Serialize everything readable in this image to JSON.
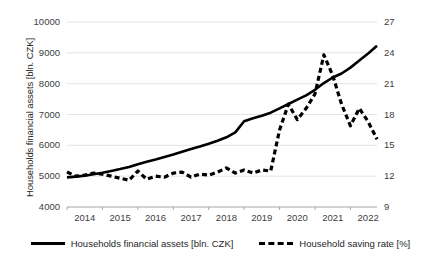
{
  "chart_data": {
    "type": "line",
    "title": "",
    "xlabel": "",
    "ylabel": "Households financial assets [bln. CZK]",
    "y2label": "Household saving rate [%]",
    "grid": true,
    "legend_position": "bottom",
    "x_tick_labels": [
      "2014",
      "2015",
      "2016",
      "2017",
      "2018",
      "2019",
      "2020",
      "2021",
      "2022"
    ],
    "y_left_ticks": [
      4000,
      5000,
      6000,
      7000,
      8000,
      9000,
      10000
    ],
    "y_right_ticks": [
      9,
      12,
      15,
      18,
      21,
      24,
      27
    ],
    "ylim": [
      4000,
      10000
    ],
    "y2lim": [
      9,
      27
    ],
    "x": [
      "2014Q1",
      "2014Q2",
      "2014Q3",
      "2014Q4",
      "2015Q1",
      "2015Q2",
      "2015Q3",
      "2015Q4",
      "2016Q1",
      "2016Q2",
      "2016Q3",
      "2016Q4",
      "2017Q1",
      "2017Q2",
      "2017Q3",
      "2017Q4",
      "2018Q1",
      "2018Q2",
      "2018Q3",
      "2018Q4",
      "2019Q1",
      "2019Q2",
      "2019Q3",
      "2019Q4",
      "2020Q1",
      "2020Q2",
      "2020Q3",
      "2020Q4",
      "2021Q1",
      "2021Q2",
      "2021Q3",
      "2021Q4",
      "2022Q1",
      "2022Q2",
      "2022Q3",
      "2022Q4"
    ],
    "series": [
      {
        "name": "Households financial assets [bln. CZK]",
        "axis": "left",
        "style": "solid",
        "color": "#000000",
        "values": [
          4960,
          4985,
          5015,
          5060,
          5110,
          5170,
          5230,
          5300,
          5390,
          5470,
          5540,
          5620,
          5700,
          5790,
          5880,
          5960,
          6050,
          6150,
          6260,
          6420,
          6780,
          6880,
          6960,
          7060,
          7200,
          7340,
          7480,
          7620,
          7800,
          8020,
          8200,
          8330,
          8520,
          8750,
          8980,
          9230
        ]
      },
      {
        "name": "Household saving rate [%]",
        "axis": "right",
        "style": "dashed",
        "color": "#000000",
        "values": [
          12.4,
          12.0,
          12.1,
          12.3,
          12.2,
          12.0,
          11.8,
          11.6,
          12.5,
          11.7,
          12.0,
          11.9,
          12.3,
          12.4,
          11.9,
          12.2,
          12.1,
          12.4,
          12.8,
          12.3,
          12.6,
          12.3,
          12.6,
          12.5,
          16.5,
          19.0,
          17.5,
          18.6,
          20.0,
          23.8,
          21.8,
          19.0,
          16.9,
          18.6,
          17.3,
          15.6
        ]
      }
    ]
  },
  "legend": {
    "items": [
      {
        "label": "Households financial assets [bln. CZK]",
        "style": "solid"
      },
      {
        "label": "Household saving rate [%]",
        "style": "dashed"
      }
    ]
  }
}
